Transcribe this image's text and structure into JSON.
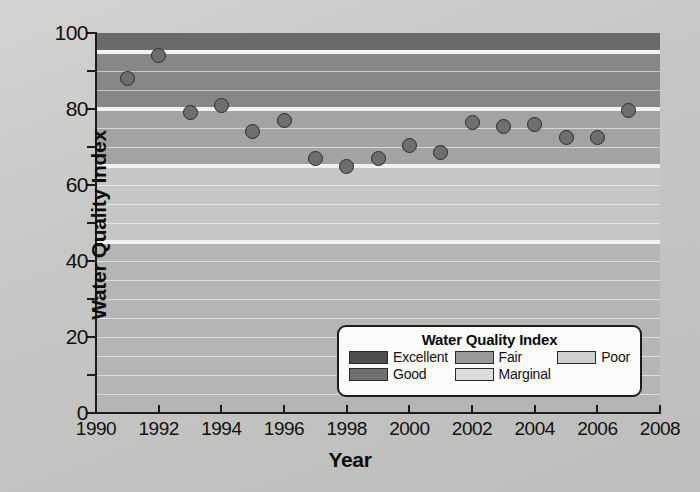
{
  "chart_data": {
    "type": "scatter",
    "title": "",
    "xlabel": "Year",
    "ylabel": "Water Quality Index",
    "xlim": [
      1990,
      2008
    ],
    "ylim": [
      0,
      100
    ],
    "xticks": [
      1990,
      1992,
      1994,
      1996,
      1998,
      2000,
      2002,
      2004,
      2006,
      2008
    ],
    "yticks": [
      0,
      20,
      40,
      60,
      80,
      100
    ],
    "y_minor_ticks": [
      10,
      30,
      50,
      70,
      90
    ],
    "grid": true,
    "legend_position": "lower-right",
    "x": [
      1991,
      1992,
      1993,
      1994,
      1995,
      1996,
      1997,
      1998,
      1999,
      2000,
      2001,
      2002,
      2003,
      2004,
      2005,
      2006,
      2007
    ],
    "values": [
      88,
      94,
      79,
      81,
      74,
      77,
      67,
      65,
      67,
      70.5,
      68.5,
      76.5,
      75.5,
      76,
      72.5,
      72.5,
      79.5
    ],
    "marker": {
      "shape": "circle",
      "fill": "#6e6e6e",
      "edge": "#2b2b2b",
      "size_px": 15
    },
    "bands": [
      {
        "name": "Excellent",
        "from": 95,
        "to": 100,
        "color": "#6a6a6a"
      },
      {
        "name": "Good",
        "from": 80,
        "to": 94,
        "color": "#878787"
      },
      {
        "name": "Fair",
        "from": 65,
        "to": 79,
        "color": "#a3a3a3"
      },
      {
        "name": "Marginal",
        "from": 45,
        "to": 64,
        "color": "#c6c6c4"
      },
      {
        "name": "Poor",
        "from": 0,
        "to": 44,
        "color": "#b5b5b3"
      }
    ]
  },
  "axes": {
    "y_title": "Water Quality Index",
    "x_title": "Year",
    "y_tick_labels": [
      "100",
      "80",
      "60",
      "40",
      "20",
      "0"
    ],
    "x_tick_labels": [
      "1990",
      "1992",
      "1994",
      "1996",
      "1998",
      "2000",
      "2002",
      "2004",
      "2006",
      "2008"
    ]
  },
  "legend": {
    "title": "Water Quality Index",
    "columns": [
      [
        {
          "label": "Excellent",
          "color": "#4e4e4e"
        },
        {
          "label": "Good",
          "color": "#6f6f6f"
        }
      ],
      [
        {
          "label": "Fair",
          "color": "#9a9a9a"
        },
        {
          "label": "Marginal",
          "color": "#dcdcda"
        }
      ],
      [
        {
          "label": "Poor",
          "color": "#cfcfcd"
        }
      ]
    ]
  }
}
